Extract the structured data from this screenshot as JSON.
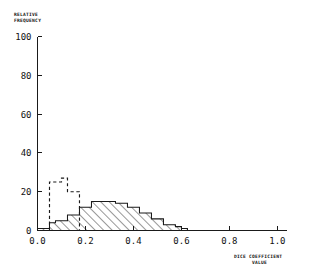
{
  "chart_data": {
    "type": "bar",
    "subtype": "overlaid-histogram",
    "title": "",
    "xlabel": "DICE COEFFICIENT VALUE",
    "ylabel": "RELATIVE FREQUENCY",
    "xlim": [
      0.0,
      1.04
    ],
    "ylim": [
      0,
      100
    ],
    "grid": false,
    "legend": "none",
    "xticks": [
      "0.0",
      "0.2",
      "0.4",
      "0.6",
      "0.8",
      "1.0"
    ],
    "xtick_values": [
      0.0,
      0.2,
      0.4,
      0.6,
      0.8,
      1.0
    ],
    "yticks": [
      "0",
      "20",
      "40",
      "60",
      "80",
      "100"
    ],
    "ytick_values": [
      0,
      20,
      40,
      60,
      80,
      100
    ],
    "bin_width": 0.025,
    "series": [
      {
        "name": "dashed-histogram",
        "style": "dashed-outline",
        "color": "#1a1a1a",
        "bin_edges": [
          0.05,
          0.075,
          0.1,
          0.125,
          0.15,
          0.175
        ],
        "values": [
          25,
          25,
          27,
          20,
          20
        ]
      },
      {
        "name": "solid-hatched-histogram",
        "style": "solid-outline-diagonal-hatch",
        "color": "#1a1a1a",
        "bin_edges": [
          0.0,
          0.025,
          0.05,
          0.075,
          0.1,
          0.125,
          0.15,
          0.175,
          0.2,
          0.225,
          0.25,
          0.275,
          0.3,
          0.325,
          0.35,
          0.375,
          0.4,
          0.425,
          0.45,
          0.475,
          0.5,
          0.525,
          0.55,
          0.575,
          0.6,
          0.625
        ],
        "values": [
          1,
          1,
          4,
          5,
          5,
          8,
          8,
          12,
          12,
          15,
          15,
          15,
          15,
          14,
          14,
          12,
          12,
          9,
          9,
          6,
          6,
          3,
          3,
          2,
          1
        ]
      }
    ]
  },
  "axis_labels": {
    "y_line1": "RELATIVE",
    "y_line2": "FREQUENCY",
    "x_line1": "DICE COEFFICIENT",
    "x_line2": "VALUE"
  }
}
